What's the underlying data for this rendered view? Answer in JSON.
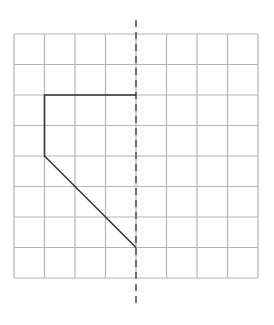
{
  "diagram": {
    "type": "symmetry-grid-exercise",
    "grid": {
      "columns": 8,
      "rows": 8,
      "origin_px": [
        14,
        34
      ],
      "cell_px": 30.5,
      "line_color": "#b4b4b4"
    },
    "axis_of_symmetry": {
      "orientation": "vertical",
      "grid_column": 4,
      "style": "dashed",
      "color": "#555555",
      "extends_px": [
        20,
        308
      ]
    },
    "half_shape": {
      "color": "#333333",
      "closed": false,
      "vertices_grid": [
        [
          4,
          2
        ],
        [
          1,
          2
        ],
        [
          1,
          4
        ],
        [
          4,
          7
        ]
      ]
    }
  }
}
